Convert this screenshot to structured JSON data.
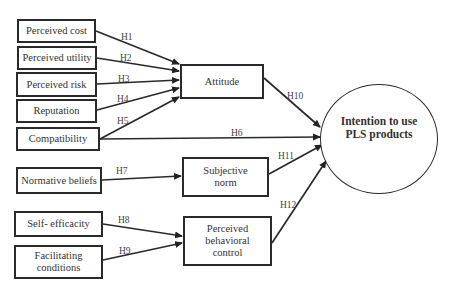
{
  "diagram": {
    "type": "structural model / hypothesis diagram",
    "nodes": {
      "perceived_cost": "Perceived cost",
      "perceived_utility": "Perceived utility",
      "perceived_risk": "Perceived risk",
      "reputation": "Reputation",
      "compatibility": "Compatibility",
      "normative_beliefs": "Normative beliefs",
      "self_efficacity": "Self- efficacity",
      "facilitating_conditions": "Facilitating conditions",
      "attitude": "Attitude",
      "subjective_norm": "Subjective norm",
      "pbc": "Perceived behavioral control",
      "intention": "Intention to use PLS products"
    },
    "edges": [
      {
        "from": "Perceived cost",
        "to": "Attitude",
        "label": "H1"
      },
      {
        "from": "Perceived utility",
        "to": "Attitude",
        "label": "H2"
      },
      {
        "from": "Perceived risk",
        "to": "Attitude",
        "label": "H3"
      },
      {
        "from": "Reputation",
        "to": "Attitude",
        "label": "H4"
      },
      {
        "from": "Compatibility",
        "to": "Attitude",
        "label": "H5"
      },
      {
        "from": "Compatibility",
        "to": "Intention to use PLS products",
        "label": "H6"
      },
      {
        "from": "Normative beliefs",
        "to": "Subjective norm",
        "label": "H7"
      },
      {
        "from": "Self- efficacity",
        "to": "Perceived behavioral control",
        "label": "H8"
      },
      {
        "from": "Facilitating conditions",
        "to": "Perceived behavioral control",
        "label": "H9"
      },
      {
        "from": "Attitude",
        "to": "Intention to use PLS products",
        "label": "H10"
      },
      {
        "from": "Subjective norm",
        "to": "Intention to use PLS products",
        "label": "H11"
      },
      {
        "from": "Perceived behavioral control",
        "to": "Intention to use PLS products",
        "label": "H12"
      }
    ],
    "labels": {
      "h1": "H1",
      "h2": "H2",
      "h3": "H3",
      "h4": "H4",
      "h5": "H5",
      "h6": "H6",
      "h7": "H7",
      "h8": "H8",
      "h9": "H9",
      "h10": "H10",
      "h11": "H11",
      "h12": "H12"
    }
  }
}
